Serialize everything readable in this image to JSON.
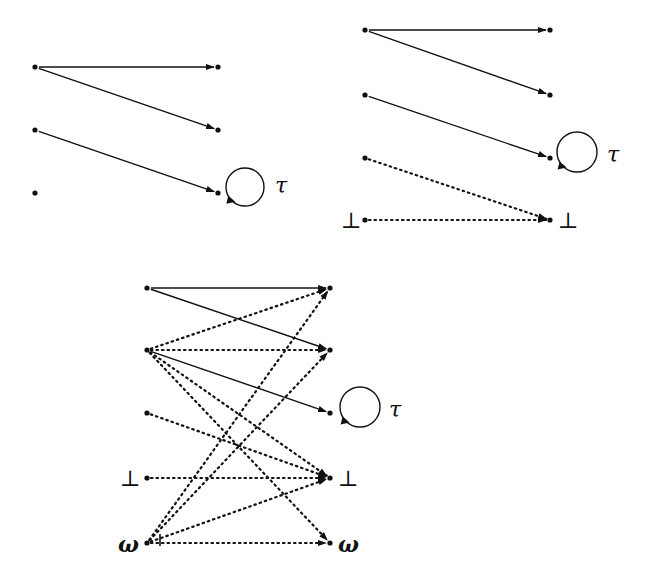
{
  "diagrams": [
    {
      "id": "top-left",
      "sources": [
        [
          35,
          67
        ],
        [
          35,
          130
        ],
        [
          35,
          193
        ]
      ],
      "targets": [
        [
          218,
          67
        ],
        [
          218,
          130
        ],
        [
          218,
          193
        ]
      ],
      "solid_arrows": [
        [
          0,
          0
        ],
        [
          0,
          1
        ],
        [
          1,
          2
        ]
      ],
      "dotted_arrows": [],
      "loop": {
        "cx": 245,
        "cy": 187,
        "r": 19,
        "label": "τ",
        "lx": 275,
        "ly": 193
      },
      "bottom_labels": []
    },
    {
      "id": "top-right",
      "sources": [
        [
          365,
          30
        ],
        [
          365,
          95
        ],
        [
          365,
          158
        ],
        [
          365,
          220
        ]
      ],
      "targets": [
        [
          550,
          30
        ],
        [
          550,
          95
        ],
        [
          550,
          158
        ],
        [
          550,
          220
        ]
      ],
      "solid_arrows": [
        [
          0,
          0
        ],
        [
          0,
          1
        ],
        [
          1,
          2
        ]
      ],
      "dotted_arrows": [
        [
          2,
          3
        ],
        [
          3,
          3
        ]
      ],
      "loop": {
        "cx": 577,
        "cy": 152,
        "r": 20,
        "label": "τ",
        "lx": 607,
        "ly": 162
      },
      "bottom_labels": [
        {
          "text": "⊥",
          "x": 341,
          "y": 228
        },
        {
          "text": "⊥",
          "x": 558,
          "y": 228
        }
      ]
    },
    {
      "id": "bottom",
      "sources": [
        [
          147,
          288
        ],
        [
          147,
          350
        ],
        [
          147,
          413
        ],
        [
          147,
          478
        ],
        [
          147,
          543
        ]
      ],
      "targets": [
        [
          330,
          288
        ],
        [
          330,
          350
        ],
        [
          330,
          413
        ],
        [
          330,
          478
        ],
        [
          330,
          543
        ]
      ],
      "solid_arrows": [
        [
          0,
          0
        ],
        [
          0,
          1
        ],
        [
          1,
          2
        ]
      ],
      "dotted_arrows": [
        [
          1,
          0
        ],
        [
          1,
          1
        ],
        [
          1,
          3
        ],
        [
          1,
          4
        ],
        [
          2,
          3
        ],
        [
          3,
          3
        ],
        [
          4,
          0
        ],
        [
          4,
          1
        ],
        [
          4,
          3
        ],
        [
          4,
          4
        ]
      ],
      "loop": {
        "cx": 360,
        "cy": 407,
        "r": 20,
        "label": "τ",
        "lx": 389,
        "ly": 417
      },
      "bottom_labels": [
        {
          "text": "⊥",
          "x": 120,
          "y": 486
        },
        {
          "text": "⊥",
          "x": 338,
          "y": 486
        },
        {
          "text": "ω",
          "x": 118,
          "y": 552
        },
        {
          "text": "ω",
          "x": 338,
          "y": 552
        }
      ]
    }
  ]
}
